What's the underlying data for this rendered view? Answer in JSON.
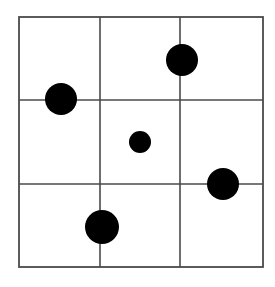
{
  "figure": {
    "kind": "dot-grid-diagram",
    "width": 275,
    "height": 287,
    "background_color": "#ffffff"
  },
  "chart_data": {
    "type": "scatter",
    "title": "",
    "subtitle": "",
    "xlabel": "",
    "ylabel": "",
    "grid": true,
    "legend": null,
    "plot_area": {
      "left": 19,
      "top": 17,
      "right": 263,
      "bottom": 267,
      "width": 244,
      "height": 250
    },
    "grid_lines": {
      "color": "#4a4a4a",
      "stroke_width": 1.6,
      "border_color": "#4a4a4a",
      "border_width": 1.8,
      "rows": 3,
      "columns": 3,
      "vertical_x": [
        100,
        180
      ],
      "horizontal_y": [
        100,
        184
      ]
    },
    "marker": {
      "shape": "circle",
      "fill_color": "#000000",
      "edge_color": "#000000"
    },
    "points": [
      {
        "id": "dot-top-right",
        "label": "top-right dot",
        "cx": 182,
        "cy": 60,
        "r": 16,
        "cell": "row1-col3",
        "size": "large"
      },
      {
        "id": "dot-mid-left",
        "label": "middle-left dot",
        "cx": 61,
        "cy": 99,
        "r": 16,
        "cell": "row1-row2-boundary-col1",
        "size": "large"
      },
      {
        "id": "dot-center-small",
        "label": "center small dot",
        "cx": 140,
        "cy": 142,
        "r": 11,
        "cell": "row2-col2",
        "size": "small"
      },
      {
        "id": "dot-mid-right",
        "label": "right dot",
        "cx": 223,
        "cy": 184,
        "r": 16,
        "cell": "row2-row3-boundary-col3",
        "size": "large"
      },
      {
        "id": "dot-bottom-center",
        "label": "bottom-center dot",
        "cx": 102,
        "cy": 227,
        "r": 17,
        "cell": "row3-col1-col2-boundary",
        "size": "large"
      }
    ]
  }
}
